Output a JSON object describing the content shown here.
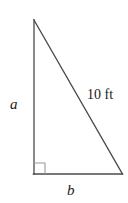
{
  "figure": {
    "type": "right-triangle-diagram",
    "background_color": "#ffffff",
    "stroke_color": "#4a4a4a",
    "stroke_width": 1.3,
    "canvas": {
      "width": 128,
      "height": 203
    },
    "vertices": {
      "apex": {
        "x": 34,
        "y": 20
      },
      "right_angle": {
        "x": 34,
        "y": 174
      },
      "base_right": {
        "x": 122,
        "y": 174
      }
    },
    "right_angle_marker": {
      "name": "right-angle-square",
      "size": 11,
      "x": 34,
      "y": 163
    },
    "labels": {
      "vertical_leg": "a",
      "horizontal_leg": "b",
      "hypotenuse": "10 ft"
    }
  }
}
